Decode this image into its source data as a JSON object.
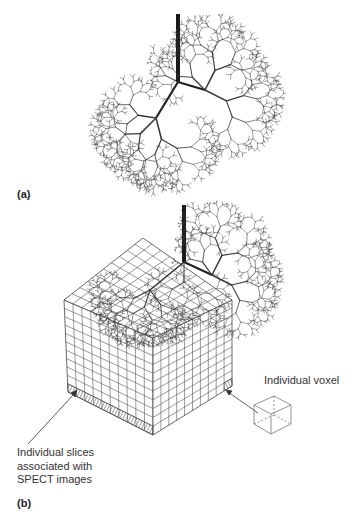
{
  "figure": {
    "panels": [
      {
        "id": "a",
        "label": "(a)",
        "description": "Branching airway tree model (fractal bronchial tree) with a single trachea trunk bifurcating into two lobes"
      },
      {
        "id": "b",
        "label": "(b)",
        "description": "Airway tree model embedded in a voxelized cubic grid",
        "annotations": {
          "slices": {
            "line1": "Individual slices",
            "line2": "associated with",
            "line3": "SPECT images"
          },
          "voxel": "Individual voxel"
        },
        "grid": {
          "left_face_columns": 10,
          "right_face_columns": 10,
          "rows": 11,
          "top_depth_cells": 10
        }
      }
    ],
    "colors": {
      "line": "#2a2a2a",
      "grid": "#555555",
      "tree": "#3a3a3a",
      "background": "#ffffff"
    }
  }
}
